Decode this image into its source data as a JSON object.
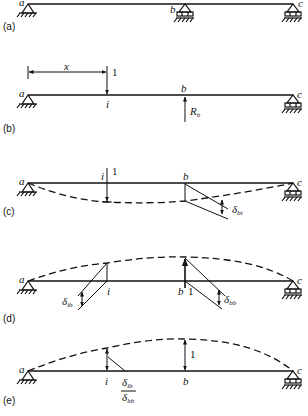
{
  "figure": {
    "panels": [
      {
        "tag": "(a)",
        "description": "Two-span continuous beam a-b-c with pin at a and rollers at b and c",
        "labels": {
          "a": "a",
          "b": "b",
          "c": "c"
        }
      },
      {
        "tag": "(b)",
        "description": "Unit load at point i, distance x from a; redundant reaction Rb at b",
        "labels": {
          "a": "a",
          "b": "b",
          "c": "c",
          "i": "i",
          "x": "x",
          "load": "1",
          "reaction": "R",
          "reaction_sub": "b"
        }
      },
      {
        "tag": "(c)",
        "description": "Deflected shape of released beam under unit load at i; deflection at b is δbi",
        "labels": {
          "a": "a",
          "b": "b",
          "c": "c",
          "i": "i",
          "load": "1",
          "delta": "δ",
          "delta_sub": "bi"
        }
      },
      {
        "tag": "(d)",
        "description": "Deflected shape due to unit upward load at b; deflections δib at i and δbb at b",
        "labels": {
          "a": "a",
          "b": "b",
          "c": "c",
          "i": "i",
          "load": "1",
          "delta_i": "δ",
          "delta_i_sub": "ib",
          "delta_b": "δ",
          "delta_b_sub": "bb"
        }
      },
      {
        "tag": "(e)",
        "description": "Influence line for Rb: ordinate 1 at b, δib/δbb at i",
        "labels": {
          "a": "a",
          "b": "b",
          "c": "c",
          "i": "i",
          "ordinate_b": "1",
          "num": "δ",
          "num_sub": "ib",
          "den": "δ",
          "den_sub": "bb"
        }
      }
    ]
  }
}
